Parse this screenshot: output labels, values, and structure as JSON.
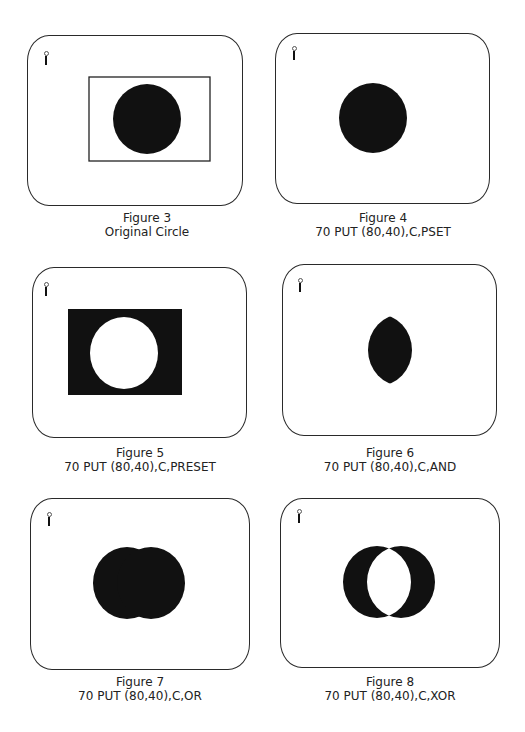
{
  "figures": [
    {
      "number": "Figure 3",
      "caption": "Original Circle",
      "mode": "original"
    },
    {
      "number": "Figure 4",
      "caption": "70 PUT (80,40),C,PSET",
      "mode": "PSET"
    },
    {
      "number": "Figure 5",
      "caption": "70 PUT (80,40),C,PRESET",
      "mode": "PRESET"
    },
    {
      "number": "Figure 6",
      "caption": "70 PUT (80,40),C,AND",
      "mode": "AND"
    },
    {
      "number": "Figure 7",
      "caption": "70 PUT (80,40),C,OR",
      "mode": "OR"
    },
    {
      "number": "Figure 8",
      "caption": "70 PUT (80,40),C,XOR",
      "mode": "XOR"
    }
  ],
  "colors": {
    "ink": "#111111",
    "paper": "#ffffff"
  }
}
